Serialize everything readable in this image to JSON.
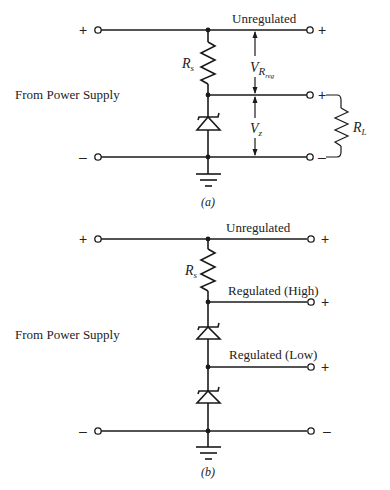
{
  "figure_a": {
    "caption": "(a)",
    "source_label": "From Power Supply",
    "input_plus": "+",
    "input_minus": "–",
    "unregulated_label": "Unregulated",
    "out_top_sign": "+",
    "out_mid_sign": "+",
    "out_bottom_sign": "–",
    "resistor_series": {
      "main": "R",
      "sub": "s"
    },
    "resistor_load": {
      "main": "R",
      "sub": "L"
    },
    "voltage_reg": {
      "main": "V",
      "sub1": "R",
      "sub2": "reg"
    },
    "voltage_zener": {
      "main": "V",
      "sub": "z"
    }
  },
  "figure_b": {
    "caption": "(b)",
    "source_label": "From Power Supply",
    "input_plus": "+",
    "input_minus": "–",
    "unregulated_label": "Unregulated",
    "regulated_high_label": "Regulated (High)",
    "regulated_low_label": "Regulated (Low)",
    "out_top_sign": "+",
    "out_high_sign": "+",
    "out_low_sign": "+",
    "out_bottom_sign": "–",
    "resistor_series": {
      "main": "R",
      "sub": "s"
    }
  }
}
